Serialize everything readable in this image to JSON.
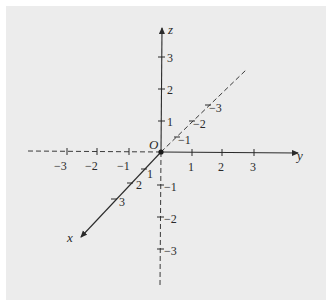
{
  "diagram": {
    "title": "",
    "origin_label": "O",
    "colors": {
      "background": "#ffffff",
      "panel": "#ececec",
      "ink": "#2a2a2a"
    },
    "axes": {
      "x": {
        "label": "x",
        "positive_ticks": [
          "1",
          "2",
          "3"
        ],
        "negative_ticks": [
          "−1",
          "−2",
          "−3"
        ],
        "positive_style": "solid",
        "negative_style": "dashed"
      },
      "y": {
        "label": "y",
        "positive_ticks": [
          "1",
          "2",
          "3"
        ],
        "negative_ticks": [
          "−1",
          "−2",
          "−3"
        ],
        "positive_style": "solid",
        "negative_style": "dashed"
      },
      "z": {
        "label": "z",
        "positive_ticks": [
          "1",
          "2",
          "3"
        ],
        "negative_ticks": [
          "−1",
          "−2",
          "−3"
        ],
        "positive_style": "solid",
        "negative_style": "dashed"
      }
    }
  }
}
